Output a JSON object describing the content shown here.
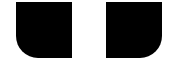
{
  "shapes": {
    "color": "#000000",
    "background": "#ffffff",
    "items": [
      {
        "name": "left-block",
        "rounded_corner": "bottom-left"
      },
      {
        "name": "right-block",
        "rounded_corner": "bottom-right"
      }
    ]
  }
}
